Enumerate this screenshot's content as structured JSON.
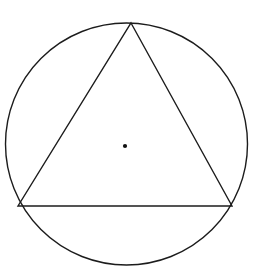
{
  "page": {
    "background_color": "#ffffff",
    "width": 258,
    "height": 267,
    "kind": "scanned-geometry-figure"
  },
  "scan_remnants": {
    "note": "partial clipped glyphs from the line of text above the figure",
    "left_fragment": "y",
    "right_fragment": "p",
    "color": "#3a3a3a"
  },
  "figure": {
    "title": "Circle with inscribed triangle",
    "stroke_color": "#1c1c1c",
    "fill_color": "none",
    "stroke_width": 1.4,
    "circle": {
      "name": "circumscribed-circle",
      "center_x": 126.5,
      "center_y": 144,
      "radius": 121
    },
    "center_point": {
      "name": "circle-center-dot",
      "x": 125,
      "y": 146,
      "radius": 2.1,
      "color": "#111111"
    },
    "triangle": {
      "name": "inscribed-triangle",
      "vertices": [
        {
          "label": "apex",
          "x": 131,
          "y": 23
        },
        {
          "label": "base-right",
          "x": 232,
          "y": 206
        },
        {
          "label": "base-left",
          "x": 18,
          "y": 206
        }
      ],
      "points_attr": "131,23 232,206 18,206"
    },
    "base_line": {
      "name": "triangle-base",
      "x1": 18,
      "y1": 206,
      "x2": 232,
      "y2": 206
    }
  }
}
